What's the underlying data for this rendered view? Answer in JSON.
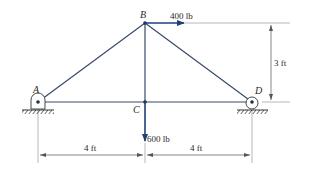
{
  "diagram": {
    "type": "truss",
    "colors": {
      "member": "#3a4a6b",
      "force": "#1f3f7a",
      "dimension": "#555555",
      "ground": "#333333"
    },
    "nodes": {
      "A": {
        "label": "A",
        "support": "pin"
      },
      "B": {
        "label": "B"
      },
      "C": {
        "label": "C"
      },
      "D": {
        "label": "D",
        "support": "roller"
      }
    },
    "members": [
      "AB",
      "BC",
      "BD",
      "AC",
      "CD"
    ],
    "loads": {
      "horizontal": {
        "node": "B",
        "label": "400 lb",
        "direction": "right"
      },
      "vertical": {
        "node": "C",
        "label": "600 lb",
        "direction": "down"
      }
    },
    "dimensions": {
      "height": "3 ft",
      "left_span": "4 ft",
      "right_span": "4 ft"
    }
  }
}
